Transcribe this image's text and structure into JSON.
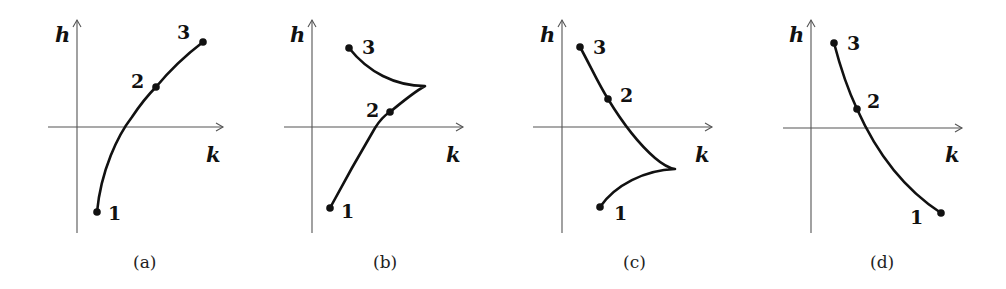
{
  "figure": {
    "axes": {
      "vertical_label": "h",
      "horizontal_label": "k"
    },
    "panels": [
      {
        "id": "a",
        "caption": "(a)",
        "description": "Monotonic increasing curve from point 1 (lower left, h<0) through 2 to 3 (upper right)",
        "points": [
          {
            "label": "1",
            "position": "h<0"
          },
          {
            "label": "2",
            "position": "h>0"
          },
          {
            "label": "3",
            "position": "h>0, largest k"
          }
        ]
      },
      {
        "id": "b",
        "caption": "(b)",
        "description": "Curve rises from 1 through 2 to a cusp at large k, then turns back to 3 (upper left)",
        "points": [
          {
            "label": "1",
            "position": "h<0"
          },
          {
            "label": "2",
            "position": "h>0, just above axis"
          },
          {
            "label": "3",
            "position": "h>0, highest"
          }
        ]
      },
      {
        "id": "c",
        "caption": "(c)",
        "description": "Curve descends from 3 through 2 to a cusp below the k-axis, then turns back to 1 (lower left)",
        "points": [
          {
            "label": "1",
            "position": "h<0, lowest"
          },
          {
            "label": "2",
            "position": "h>0"
          },
          {
            "label": "3",
            "position": "h>0, highest"
          }
        ]
      },
      {
        "id": "d",
        "caption": "(d)",
        "description": "Monotonic decreasing curve from 3 (upper left) through 2 to 1 (lower right)",
        "points": [
          {
            "label": "1",
            "position": "h<0, largest k"
          },
          {
            "label": "2",
            "position": "h>0"
          },
          {
            "label": "3",
            "position": "h>0, highest"
          }
        ]
      }
    ]
  }
}
